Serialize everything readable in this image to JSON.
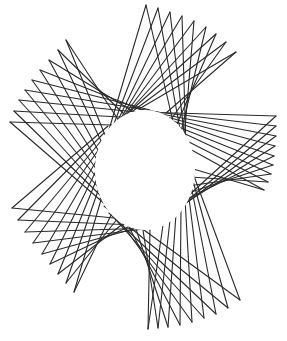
{
  "figure": {
    "width": 287,
    "height": 341,
    "background": "#ffffff",
    "stroke_color": "#2a2a2a",
    "center": {
      "cx": 145,
      "cy": 170
    },
    "hole": {
      "rx": 50,
      "ry": 60
    },
    "chevrons_per_arm": 9,
    "arms": [
      {
        "name": "top",
        "tips": [
          [
            146,
            5
          ],
          [
            158,
            8
          ],
          [
            170,
            12
          ],
          [
            182,
            16
          ],
          [
            194,
            21
          ],
          [
            206,
            27
          ],
          [
            216,
            34
          ],
          [
            226,
            42
          ],
          [
            236,
            52
          ]
        ],
        "base_a": [
          [
            100,
            160
          ],
          [
            104,
            150
          ],
          [
            108,
            141
          ],
          [
            112,
            133
          ],
          [
            117,
            125
          ],
          [
            122,
            119
          ],
          [
            127,
            114
          ],
          [
            133,
            111
          ],
          [
            139,
            109
          ]
        ],
        "base_b": [
          [
            186,
            178
          ],
          [
            187,
            168
          ],
          [
            187,
            158
          ],
          [
            186,
            149
          ],
          [
            184,
            140
          ],
          [
            181,
            132
          ],
          [
            177,
            124
          ],
          [
            172,
            118
          ],
          [
            166,
            113
          ]
        ]
      },
      {
        "name": "right",
        "tips": [
          [
            276,
            116
          ],
          [
            276,
            126
          ],
          [
            276,
            136
          ],
          [
            275,
            146
          ],
          [
            274,
            156
          ],
          [
            273,
            165
          ],
          [
            271,
            174
          ],
          [
            268,
            182
          ],
          [
            264,
            190
          ]
        ],
        "base_a": [
          [
            140,
            112
          ],
          [
            148,
            111
          ],
          [
            156,
            113
          ],
          [
            163,
            116
          ],
          [
            170,
            120
          ],
          [
            176,
            126
          ],
          [
            181,
            132
          ],
          [
            185,
            140
          ],
          [
            188,
            148
          ]
        ],
        "base_b": [
          [
            155,
            226
          ],
          [
            163,
            221
          ],
          [
            170,
            215
          ],
          [
            176,
            209
          ],
          [
            181,
            202
          ],
          [
            185,
            194
          ],
          [
            188,
            186
          ],
          [
            190,
            177
          ],
          [
            190,
            168
          ]
        ]
      },
      {
        "name": "bottom-right",
        "tips": [
          [
            240,
            300
          ],
          [
            228,
            308
          ],
          [
            216,
            314
          ],
          [
            204,
            318
          ],
          [
            192,
            322
          ],
          [
            180,
            325
          ],
          [
            168,
            327
          ],
          [
            158,
            328
          ],
          [
            148,
            329
          ]
        ],
        "base_a": [
          [
            188,
            160
          ],
          [
            190,
            170
          ],
          [
            190,
            180
          ],
          [
            188,
            190
          ],
          [
            185,
            199
          ],
          [
            181,
            207
          ],
          [
            176,
            214
          ],
          [
            170,
            220
          ],
          [
            163,
            225
          ]
        ],
        "base_b": [
          [
            100,
            198
          ],
          [
            104,
            206
          ],
          [
            109,
            213
          ],
          [
            115,
            219
          ],
          [
            122,
            224
          ],
          [
            129,
            227
          ],
          [
            136,
            229
          ],
          [
            143,
            230
          ],
          [
            150,
            229
          ]
        ]
      },
      {
        "name": "bottom-left",
        "tips": [
          [
            12,
            208
          ],
          [
            18,
            220
          ],
          [
            25,
            232
          ],
          [
            33,
            243
          ],
          [
            42,
            254
          ],
          [
            50,
            264
          ],
          [
            58,
            274
          ],
          [
            66,
            283
          ],
          [
            74,
            292
          ]
        ],
        "base_a": [
          [
            165,
            223
          ],
          [
            158,
            226
          ],
          [
            151,
            228
          ],
          [
            144,
            229
          ],
          [
            137,
            228
          ],
          [
            130,
            226
          ],
          [
            124,
            223
          ],
          [
            118,
            218
          ],
          [
            112,
            213
          ]
        ],
        "base_b": [
          [
            108,
            126
          ],
          [
            104,
            133
          ],
          [
            101,
            141
          ],
          [
            99,
            149
          ],
          [
            98,
            158
          ],
          [
            98,
            167
          ],
          [
            98,
            176
          ],
          [
            100,
            185
          ],
          [
            103,
            193
          ]
        ]
      },
      {
        "name": "left",
        "tips": [
          [
            10,
            122
          ],
          [
            14,
            111
          ],
          [
            19,
            100
          ],
          [
            25,
            90
          ],
          [
            32,
            80
          ],
          [
            40,
            70
          ],
          [
            49,
            60
          ],
          [
            58,
            50
          ],
          [
            66,
            40
          ]
        ],
        "base_a": [
          [
            106,
            205
          ],
          [
            102,
            197
          ],
          [
            99,
            188
          ],
          [
            98,
            179
          ],
          [
            97,
            170
          ],
          [
            98,
            161
          ],
          [
            99,
            152
          ],
          [
            102,
            143
          ],
          [
            105,
            135
          ]
        ],
        "base_b": [
          [
            178,
            127
          ],
          [
            172,
            120
          ],
          [
            165,
            115
          ],
          [
            158,
            112
          ],
          [
            150,
            110
          ],
          [
            142,
            110
          ],
          [
            134,
            112
          ],
          [
            126,
            116
          ],
          [
            119,
            121
          ]
        ]
      }
    ]
  }
}
